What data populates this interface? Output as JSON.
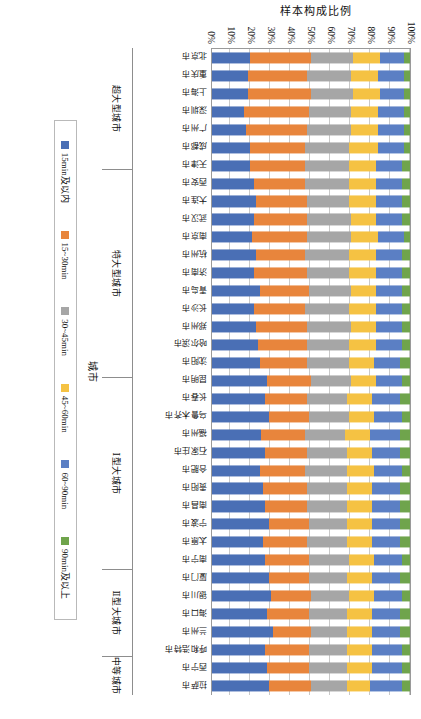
{
  "chart_data": {
    "type": "bar",
    "subtype": "stacked-percent-horizontal",
    "title": "",
    "xlabel": "城市",
    "ylabel": "样本构成比例",
    "ylim": [
      0,
      100
    ],
    "ytick_labels": [
      "0%",
      "10%",
      "20%",
      "30%",
      "40%",
      "50%",
      "60%",
      "70%",
      "80%",
      "90%",
      "100%"
    ],
    "grid": true,
    "legend_position": "bottom",
    "orientation": "rotated-90-clockwise",
    "legend": [
      "15min及以内",
      "15~30min",
      "30~45min",
      "45~60min",
      "60~90min",
      "90min及以上"
    ],
    "colors": [
      "#4a6fb5",
      "#e8853c",
      "#a6a6a6",
      "#f5c243",
      "#5b7fc4",
      "#6fa44c"
    ],
    "categories": [
      "北京市",
      "重庆市",
      "上海市",
      "深圳市",
      "广州市",
      "成都市",
      "天津市",
      "西安市",
      "大连市",
      "武汉市",
      "南京市",
      "杭州市",
      "济南市",
      "青岛市",
      "长沙市",
      "郑州市",
      "哈尔滨市",
      "沈阳市",
      "昆明市",
      "长春市",
      "乌鲁木齐市",
      "福州市",
      "石家庄市",
      "合肥市",
      "贵阳市",
      "南昌市",
      "宁波市",
      "太原市",
      "南宁市",
      "厦门市",
      "银川市",
      "海口市",
      "兰州市",
      "呼和浩特市",
      "西宁市",
      "拉萨市"
    ],
    "groups": [
      {
        "label": "超大型城市",
        "count": 7
      },
      {
        "label": "特大型城市",
        "count": 12
      },
      {
        "label": "Ⅰ型大城市",
        "count": 11
      },
      {
        "label": "Ⅱ型大城市",
        "count": 5
      },
      {
        "label": "中等城市",
        "count": 1
      }
    ],
    "series": [
      {
        "name": "15min及以内",
        "color": "#4a6fb5",
        "values": [
          19,
          18,
          18,
          16,
          17,
          19,
          19,
          21,
          22,
          21,
          20,
          22,
          21,
          24,
          21,
          22,
          23,
          24,
          28,
          27,
          29,
          25,
          27,
          24,
          26,
          27,
          29,
          26,
          27,
          29,
          30,
          28,
          31,
          27,
          28,
          29
        ]
      },
      {
        "name": "15~30min",
        "color": "#e8853c",
        "values": [
          31,
          30,
          32,
          33,
          31,
          28,
          28,
          26,
          26,
          27,
          28,
          25,
          27,
          25,
          26,
          26,
          25,
          24,
          22,
          21,
          20,
          22,
          21,
          23,
          22,
          21,
          20,
          22,
          22,
          20,
          20,
          21,
          19,
          22,
          21,
          21
        ]
      },
      {
        "name": "30~45min",
        "color": "#a6a6a6",
        "values": [
          21,
          22,
          21,
          21,
          22,
          22,
          22,
          22,
          21,
          22,
          22,
          22,
          21,
          21,
          22,
          22,
          21,
          21,
          20,
          20,
          20,
          20,
          20,
          21,
          20,
          20,
          19,
          20,
          20,
          19,
          19,
          19,
          18,
          19,
          19,
          18
        ]
      },
      {
        "name": "45~60min",
        "color": "#f5c243",
        "values": [
          14,
          14,
          14,
          14,
          14,
          15,
          14,
          14,
          14,
          13,
          14,
          14,
          14,
          13,
          14,
          13,
          14,
          13,
          13,
          13,
          13,
          13,
          13,
          14,
          13,
          13,
          13,
          13,
          13,
          13,
          13,
          13,
          13,
          13,
          13,
          12
        ]
      },
      {
        "name": "60~90min",
        "color": "#5b7fc4",
        "values": [
          12,
          13,
          12,
          13,
          13,
          13,
          13,
          13,
          13,
          13,
          13,
          13,
          13,
          13,
          13,
          13,
          13,
          13,
          13,
          14,
          14,
          15,
          14,
          14,
          14,
          14,
          14,
          14,
          14,
          14,
          14,
          14,
          14,
          15,
          15,
          16
        ]
      },
      {
        "name": "90min及以上",
        "color": "#6fa44c",
        "values": [
          3,
          3,
          3,
          3,
          3,
          3,
          4,
          4,
          4,
          4,
          3,
          4,
          4,
          4,
          4,
          4,
          4,
          5,
          4,
          5,
          4,
          5,
          5,
          4,
          5,
          5,
          5,
          5,
          4,
          5,
          4,
          5,
          5,
          4,
          4,
          4
        ]
      }
    ]
  }
}
